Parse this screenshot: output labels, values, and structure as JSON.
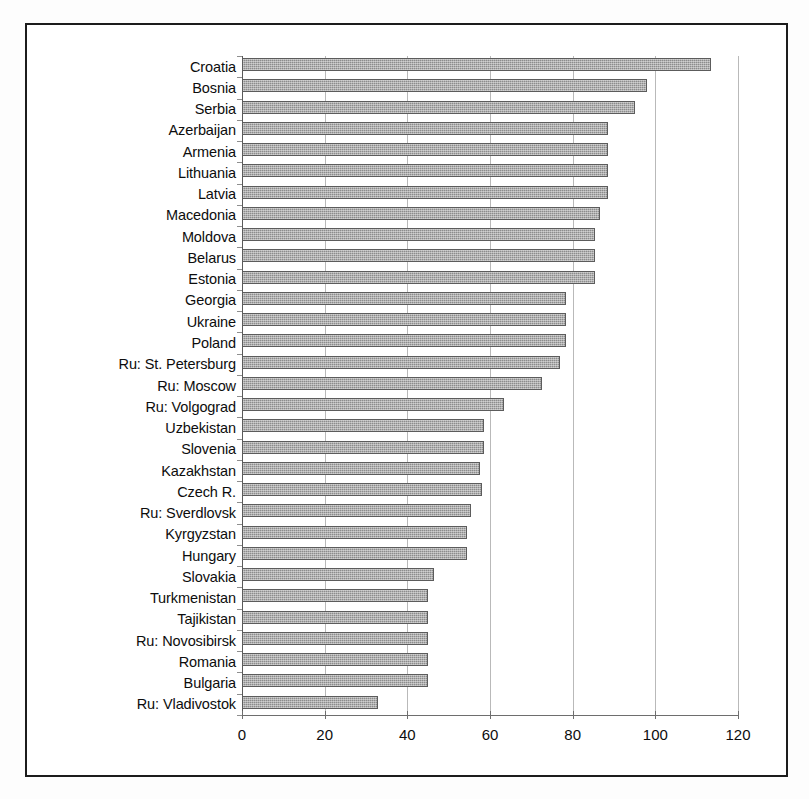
{
  "chart_data": {
    "type": "bar",
    "orientation": "horizontal",
    "title": "",
    "subtitle": "",
    "xlabel": "",
    "ylabel": "",
    "xlim": [
      0,
      120
    ],
    "xticks": [
      0,
      20,
      40,
      60,
      80,
      100,
      120
    ],
    "xtick_labels": [
      "0",
      "20",
      "40",
      "60",
      "80",
      "100",
      "120"
    ],
    "grid": "vertical",
    "legend": null,
    "series_name": "",
    "bar_color": "#8c8c8c",
    "bar_edge_color": "#5c5c5c",
    "gridline_color": "#b9b9b9",
    "axis_color": "#6e6e6e",
    "frame_color": "#1c1c1c",
    "categories": [
      "Croatia",
      "Bosnia",
      "Serbia",
      "Azerbaijan",
      "Armenia",
      "Lithuania",
      "Latvia",
      "Macedonia",
      "Moldova",
      "Belarus",
      "Estonia",
      "Georgia",
      "Ukraine",
      "Poland",
      "Ru: St. Petersburg",
      "Ru: Moscow",
      "Ru: Volgograd",
      "Uzbekistan",
      "Slovenia",
      "Kazakhstan",
      "Czech R.",
      "Ru: Sverdlovsk",
      "Kyrgyzstan",
      "Hungary",
      "Slovakia",
      "Turkmenistan",
      "Tajikistan",
      "Ru: Novosibirsk",
      "Romania",
      "Bulgaria",
      "Ru: Vladivostok"
    ],
    "values": [
      113.5,
      98,
      95,
      88.5,
      88.5,
      88.5,
      88.5,
      86.5,
      85.5,
      85.5,
      85.5,
      78.5,
      78.5,
      78.5,
      77,
      72.5,
      63.5,
      58.5,
      58.5,
      57.5,
      58,
      55.5,
      54.5,
      54.5,
      46.5,
      45,
      45,
      45,
      45,
      45,
      33
    ]
  }
}
